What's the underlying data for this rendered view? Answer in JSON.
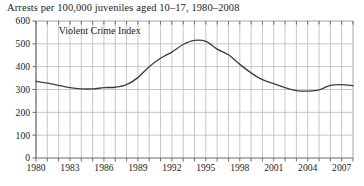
{
  "chart_data": {
    "type": "line",
    "title": "Arrests per 100,000 juveniles aged 10–17, 1980–2008",
    "xlabel": "",
    "ylabel": "",
    "xlim": [
      1980,
      2008
    ],
    "ylim": [
      0,
      600
    ],
    "grid": true,
    "legend": "none",
    "annotations": [
      {
        "text": "Violent Crime Index",
        "x": 1982,
        "y": 545
      }
    ],
    "y_ticks": [
      0,
      100,
      200,
      300,
      400,
      500,
      600
    ],
    "y_tick_labels": [
      "0",
      "100",
      "200",
      "300",
      "400",
      "500",
      "600"
    ],
    "x_ticks": [
      1980,
      1983,
      1986,
      1989,
      1992,
      1995,
      1998,
      2001,
      2004,
      2007
    ],
    "x_tick_labels": [
      "1980",
      "1983",
      "1986",
      "1989",
      "1992",
      "1995",
      "1998",
      "2001",
      "2004",
      "2007"
    ],
    "x_minor_ticks": [
      1980,
      1981,
      1982,
      1983,
      1984,
      1985,
      1986,
      1987,
      1988,
      1989,
      1990,
      1991,
      1992,
      1993,
      1994,
      1995,
      1996,
      1997,
      1998,
      1999,
      2000,
      2001,
      2002,
      2003,
      2004,
      2005,
      2006,
      2007,
      2008
    ],
    "series": [
      {
        "name": "Violent Crime Index",
        "color": "#3f3f3f",
        "x": [
          1980,
          1981,
          1982,
          1983,
          1984,
          1985,
          1986,
          1987,
          1988,
          1989,
          1990,
          1991,
          1992,
          1993,
          1994,
          1995,
          1996,
          1997,
          1998,
          1999,
          2000,
          2001,
          2002,
          2003,
          2004,
          2005,
          2006,
          2007,
          2008
        ],
        "values": [
          336,
          328,
          318,
          308,
          303,
          303,
          308,
          310,
          321,
          352,
          400,
          437,
          464,
          497,
          515,
          511,
          477,
          452,
          410,
          373,
          343,
          326,
          308,
          295,
          293,
          298,
          318,
          321,
          317
        ]
      }
    ]
  },
  "colors": {
    "line": "#3f3f3f",
    "grid": "#b9b9b9",
    "axis": "#6b6b6b",
    "text": "#1d1d1d",
    "background": "#ffffff"
  }
}
